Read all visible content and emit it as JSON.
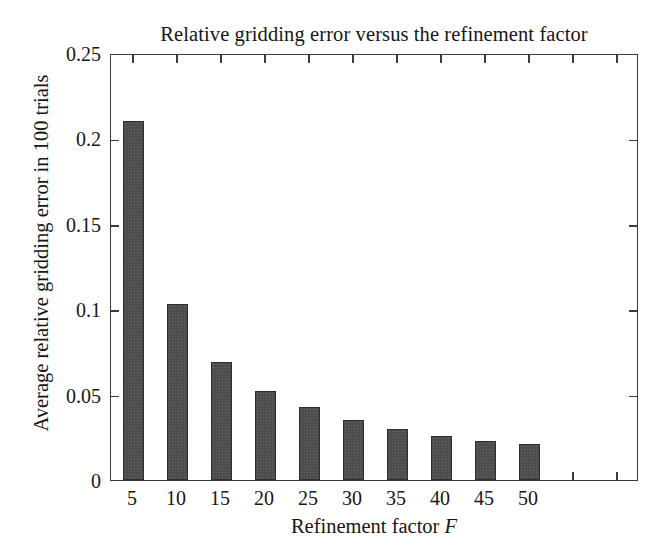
{
  "figure": {
    "background_color": "#ffffff",
    "frame_color": "#3b3b3b",
    "text_color": "#161616"
  },
  "chart_data": {
    "type": "bar",
    "title": "Relative gridding error versus the refinement factor",
    "xlabel_prefix": "Refinement factor",
    "xlabel_symbol": "F",
    "ylabel": "Average relative gridding error in 100 trials",
    "categories": [
      "5",
      "10",
      "15",
      "20",
      "25",
      "30",
      "35",
      "40",
      "45",
      "50"
    ],
    "values": [
      0.21,
      0.103,
      0.069,
      0.052,
      0.043,
      0.035,
      0.03,
      0.026,
      0.023,
      0.021
    ],
    "series": [
      {
        "name": "Average relative gridding error",
        "values": [
          0.21,
          0.103,
          0.069,
          0.052,
          0.043,
          0.035,
          0.03,
          0.026,
          0.023,
          0.021
        ]
      }
    ],
    "ylim": [
      0,
      0.25
    ],
    "ytick_values": [
      0,
      0.05,
      0.1,
      0.15,
      0.2,
      0.25
    ],
    "ytick_labels": [
      "0",
      "0.05",
      "0.1",
      "0.15",
      "0.2",
      "0.25"
    ],
    "xtick_labels": [
      "5",
      "10",
      "15",
      "20",
      "25",
      "30",
      "35",
      "40",
      "45",
      "50"
    ],
    "n_x_slots": 12,
    "grid": false,
    "legend": false,
    "bar_color": "#4d4d4d",
    "bar_edge_color": "#2e2e2e"
  }
}
